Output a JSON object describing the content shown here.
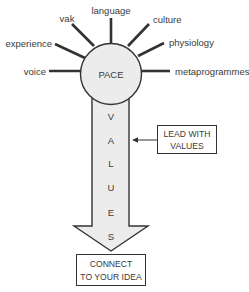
{
  "diagram": {
    "center": {
      "label": "PACE"
    },
    "spokes": [
      {
        "label": "voice"
      },
      {
        "label": "experience"
      },
      {
        "label": "vak"
      },
      {
        "label": "language"
      },
      {
        "label": "culture"
      },
      {
        "label": "physiology"
      },
      {
        "label": "metaprogrammes"
      }
    ],
    "arrow_letters": [
      "V",
      "A",
      "L",
      "U",
      "E",
      "S"
    ],
    "side_box": {
      "line1": "LEAD WITH",
      "line2": "VALUES"
    },
    "bottom_box": {
      "line1": "CONNECT",
      "line2": "TO YOUR IDEA"
    },
    "colors": {
      "fill": "#ececec",
      "stroke": "#333333",
      "text": "#3a3a3a"
    }
  }
}
